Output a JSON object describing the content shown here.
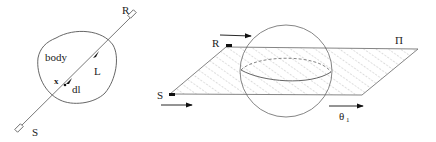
{
  "left_panel": {
    "labels": {
      "body": "body",
      "L": "L",
      "x": "x",
      "dl": "dl",
      "R": "R",
      "S": "S"
    }
  },
  "right_panel": {
    "labels": {
      "R": "R",
      "S": "S",
      "Pi": "Π",
      "theta": "θ",
      "theta_sub": "1"
    }
  },
  "colors": {
    "stroke": "#555555",
    "hatch": "#888888",
    "text": "#222222"
  }
}
